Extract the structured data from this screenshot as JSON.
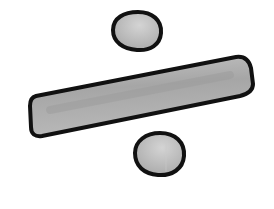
{
  "illustration": {
    "subject": "Division symbol (÷)",
    "style": "hand-drawn, grey fill with black outline",
    "colors": {
      "background": "#ffffff",
      "outline": "#111111",
      "fill": "#b4b4b4",
      "fill_dark": "#9a9a9a",
      "highlight": "#d2d2d2"
    }
  }
}
